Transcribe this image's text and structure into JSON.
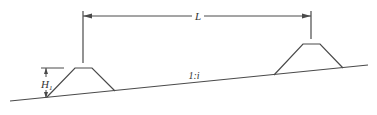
{
  "diagram": {
    "type": "cross-section sketch of two trapezoidal embankments on a sloped ground",
    "labels": {
      "spacing": "L",
      "height": "H",
      "height_subscript": "1",
      "slope": "1:i"
    },
    "colors": {
      "line": "#4a4a4a",
      "background": "#ffffff"
    }
  }
}
